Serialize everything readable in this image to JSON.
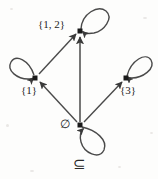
{
  "figure": {
    "caption": "⊆",
    "caption_name": "subset-or-equal-relation-symbol",
    "width": 158,
    "height": 179,
    "background_color": "#fdfdfc",
    "stroke_color": "#3a3a3a",
    "label_color": "#1c1c1c"
  },
  "nodes": [
    {
      "id": "top",
      "label": "{1, 2}",
      "x": 80,
      "y": 31,
      "label_x": 38,
      "label_y": 24,
      "self_loop": true
    },
    {
      "id": "left",
      "label": "{1}",
      "x": 35,
      "y": 78,
      "label_x": 21,
      "label_y": 85,
      "self_loop": true
    },
    {
      "id": "right",
      "label": "{3}",
      "x": 126,
      "y": 78,
      "label_x": 120,
      "label_y": 85,
      "self_loop": true
    },
    {
      "id": "bottom",
      "label": "∅",
      "x": 80,
      "y": 125,
      "label_x": 61,
      "label_y": 120,
      "self_loop": true
    }
  ],
  "edges": [
    {
      "id": "empty-to-one",
      "from": "bottom",
      "to": "left",
      "kind": "directed"
    },
    {
      "id": "empty-to-three",
      "from": "bottom",
      "to": "right",
      "kind": "directed"
    },
    {
      "id": "empty-to-onetwo",
      "from": "bottom",
      "to": "top",
      "kind": "directed"
    },
    {
      "id": "one-to-onetwo",
      "from": "left",
      "to": "top",
      "kind": "directed"
    }
  ],
  "self_loops": [
    {
      "id": "loop-onetwo",
      "node": "top",
      "direction": "up-right"
    },
    {
      "id": "loop-one",
      "node": "left",
      "direction": "up-left"
    },
    {
      "id": "loop-three",
      "node": "right",
      "direction": "up-right"
    },
    {
      "id": "loop-empty",
      "node": "bottom",
      "direction": "down-right"
    }
  ]
}
